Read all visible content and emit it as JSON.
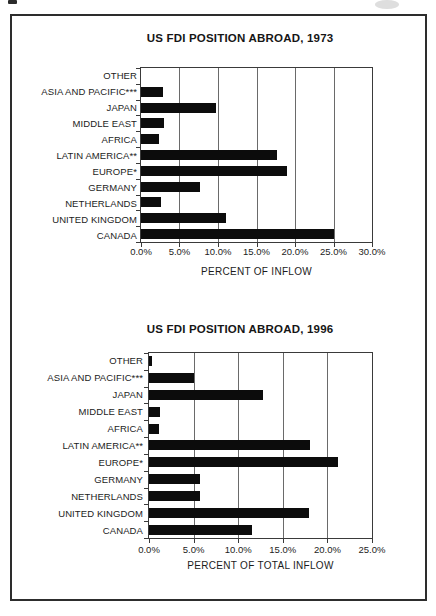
{
  "page": {
    "background_color": "#ffffff",
    "bar_color": "#0c0c0c"
  },
  "chart_data": [
    {
      "type": "bar",
      "orientation": "horizontal",
      "title": "US FDI POSITION ABROAD, 1973",
      "xlabel": "PERCENT OF INFLOW",
      "categories": [
        "OTHER",
        "ASIA AND PACIFIC***",
        "JAPAN",
        "MIDDLE EAST",
        "AFRICA",
        "LATIN AMERICA**",
        "EUROPE*",
        "GERMANY",
        "NETHERLANDS",
        "UNITED KINGDOM",
        "CANADA"
      ],
      "values": [
        0.0,
        2.9,
        9.8,
        3.0,
        2.3,
        17.7,
        19.0,
        7.7,
        2.6,
        11.1,
        25.0
      ],
      "xlim": [
        0,
        30
      ],
      "xticks": [
        "0.0%",
        "5.0%",
        "10.0%",
        "15.0%",
        "20.0%",
        "25.0%",
        "30.0%"
      ],
      "grid": true,
      "legend": false,
      "bar_color": "#0c0c0c"
    },
    {
      "type": "bar",
      "orientation": "horizontal",
      "title": "US FDI POSITION ABROAD, 1996",
      "xlabel": "PERCENT OF TOTAL INFLOW",
      "categories": [
        "OTHER",
        "ASIA AND PACIFIC***",
        "JAPAN",
        "MIDDLE EAST",
        "AFRICA",
        "LATIN AMERICA**",
        "EUROPE*",
        "GERMANY",
        "NETHERLANDS",
        "UNITED KINGDOM",
        "CANADA"
      ],
      "values": [
        0.3,
        5.0,
        12.8,
        1.2,
        1.1,
        18.1,
        21.2,
        5.7,
        5.7,
        17.9,
        11.6
      ],
      "xlim": [
        0,
        25
      ],
      "xticks": [
        "0.0%",
        "5.0%",
        "10.0%",
        "15.0%",
        "20.0%",
        "25.0%"
      ],
      "grid": true,
      "legend": false,
      "bar_color": "#0c0c0c"
    }
  ]
}
